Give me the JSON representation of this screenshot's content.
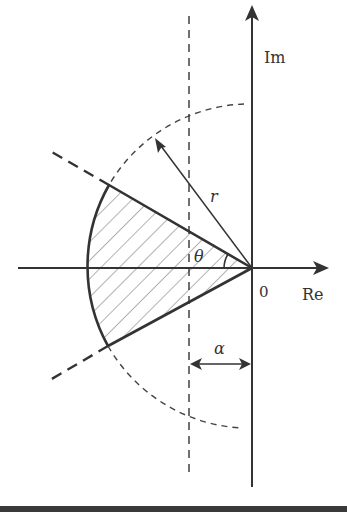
{
  "diagram": {
    "labels": {
      "imag_axis": "Im",
      "real_axis": "Re",
      "origin": "0",
      "radius": "r",
      "angle": "θ",
      "offset": "α"
    },
    "elements": [
      {
        "type": "axis",
        "name": "real-axis",
        "direction": "horizontal"
      },
      {
        "type": "axis",
        "name": "imaginary-axis",
        "direction": "vertical"
      },
      {
        "type": "dashed-circle",
        "name": "radius-circle",
        "center": "origin",
        "radius_label": "r"
      },
      {
        "type": "dashed-line",
        "name": "vertical-offset-line",
        "offset_label": "α"
      },
      {
        "type": "dashed-rays",
        "name": "sector-boundary-rays",
        "angle_label": "θ"
      },
      {
        "type": "hatched-sector",
        "name": "allowed-region"
      }
    ],
    "colors": {
      "stroke": "#333333",
      "background": "#ffffff"
    }
  }
}
